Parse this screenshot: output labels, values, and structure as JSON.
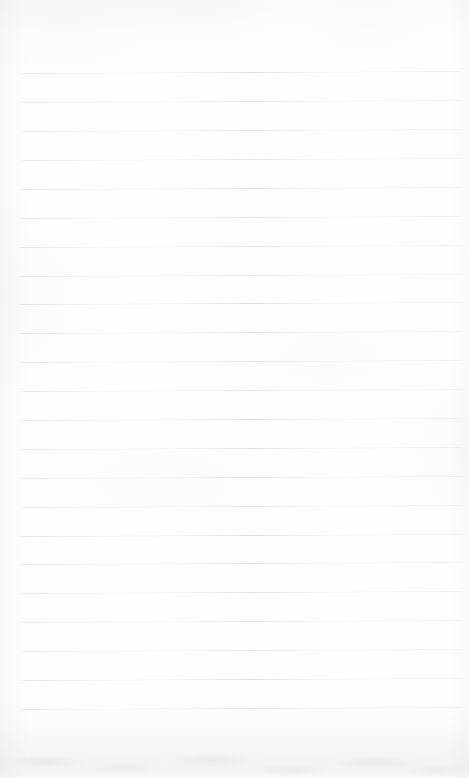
{
  "document": {
    "kind": "scanned-lined-notebook-page",
    "title": "Blank ruled notebook page",
    "page_width": 469,
    "page_height": 778,
    "paper_color": "#fefefe",
    "content_text": "",
    "handwriting_present": "no",
    "printed_text_present": "no"
  },
  "ruling": {
    "line_color": "#dcdfe0",
    "line_count": 23,
    "line_thickness": 1,
    "spacing": 28.9,
    "first_line_y": 73,
    "last_line_y": 709,
    "left_margin_x": 18,
    "right_end_x": 463,
    "tilt_degrees": -0.26,
    "margin_rule_present": "no",
    "lines": [
      {
        "index": 1,
        "y": 73,
        "x_start": 19,
        "x_end": 462
      },
      {
        "index": 2,
        "y": 102,
        "x_start": 19,
        "x_end": 462
      },
      {
        "index": 3,
        "y": 131,
        "x_start": 19,
        "x_end": 463
      },
      {
        "index": 4,
        "y": 160,
        "x_start": 19,
        "x_end": 463
      },
      {
        "index": 5,
        "y": 189,
        "x_start": 18,
        "x_end": 463
      },
      {
        "index": 6,
        "y": 218,
        "x_start": 18,
        "x_end": 463
      },
      {
        "index": 7,
        "y": 247,
        "x_start": 18,
        "x_end": 463
      },
      {
        "index": 8,
        "y": 276,
        "x_start": 18,
        "x_end": 463
      },
      {
        "index": 9,
        "y": 304,
        "x_start": 18,
        "x_end": 463
      },
      {
        "index": 10,
        "y": 333,
        "x_start": 18,
        "x_end": 463
      },
      {
        "index": 11,
        "y": 362,
        "x_start": 18,
        "x_end": 463
      },
      {
        "index": 12,
        "y": 391,
        "x_start": 18,
        "x_end": 463
      },
      {
        "index": 13,
        "y": 420,
        "x_start": 18,
        "x_end": 463
      },
      {
        "index": 14,
        "y": 449,
        "x_start": 18,
        "x_end": 463
      },
      {
        "index": 15,
        "y": 478,
        "x_start": 18,
        "x_end": 463
      },
      {
        "index": 16,
        "y": 507,
        "x_start": 18,
        "x_end": 463
      },
      {
        "index": 17,
        "y": 536,
        "x_start": 18,
        "x_end": 463
      },
      {
        "index": 18,
        "y": 564,
        "x_start": 18,
        "x_end": 463
      },
      {
        "index": 19,
        "y": 593,
        "x_start": 18,
        "x_end": 463
      },
      {
        "index": 20,
        "y": 622,
        "x_start": 18,
        "x_end": 463
      },
      {
        "index": 21,
        "y": 651,
        "x_start": 19,
        "x_end": 463
      },
      {
        "index": 22,
        "y": 680,
        "x_start": 19,
        "x_end": 463
      },
      {
        "index": 23,
        "y": 709,
        "x_start": 19,
        "x_end": 463
      }
    ]
  },
  "scan_artifacts": {
    "bottom_shadow": "yes",
    "vignette": "yes",
    "mottling": "subtle",
    "shadow_color": "#929497"
  }
}
